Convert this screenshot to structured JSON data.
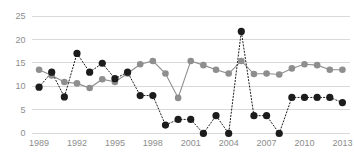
{
  "chart_data": {
    "type": "line",
    "title": "",
    "subtitle": "",
    "xlabel": "",
    "ylabel": "",
    "xlim": [
      1988.4,
      2013.6
    ],
    "ylim": [
      0,
      25
    ],
    "yticks": [
      0,
      5,
      10,
      15,
      20,
      25
    ],
    "ytick_labels": [
      "0",
      "5",
      "10",
      "15",
      "20",
      "25"
    ],
    "xticks": [
      1989,
      1992,
      1995,
      1998,
      2001,
      2004,
      2007,
      2010,
      2013
    ],
    "xtick_labels": [
      "1989",
      "1992",
      "1995",
      "1998",
      "2001",
      "2004",
      "2007",
      "2010",
      "2013"
    ],
    "x": [
      1989,
      1990,
      1991,
      1992,
      1993,
      1994,
      1995,
      1996,
      1997,
      1998,
      1999,
      2000,
      2001,
      2002,
      2003,
      2004,
      2005,
      2006,
      2007,
      2008,
      2009,
      2010,
      2011,
      2012,
      2013
    ],
    "grid": "horizontal",
    "legend_position": "none",
    "colors": {
      "series_gray": "#8e8e8e",
      "series_black": "#1c1c1c",
      "gridline": "#c9c9c9",
      "tick_label": "#8d8d8d",
      "background": "#ffffff"
    },
    "series": [
      {
        "name": "Series A",
        "style": "solid",
        "marker": "circle",
        "color": "#8e8e8e",
        "values": [
          13.5,
          12.3,
          10.9,
          10.6,
          9.6,
          11.5,
          10.9,
          12.7,
          14.7,
          15.4,
          12.7,
          7.5,
          15.4,
          14.5,
          13.5,
          12.7,
          15.4,
          12.6,
          12.7,
          12.5,
          13.8,
          14.7,
          14.5,
          13.5,
          13.5
        ]
      },
      {
        "name": "Series B",
        "style": "dotted",
        "marker": "circle",
        "color": "#1c1c1c",
        "values": [
          9.8,
          13.0,
          7.7,
          17.0,
          13.0,
          14.9,
          11.6,
          13.0,
          8.0,
          8.0,
          1.7,
          2.9,
          2.9,
          -0.1,
          3.7,
          -0.1,
          21.7,
          3.7,
          3.7,
          -0.1,
          7.6,
          7.6,
          7.6,
          7.6,
          6.5
        ]
      }
    ]
  }
}
